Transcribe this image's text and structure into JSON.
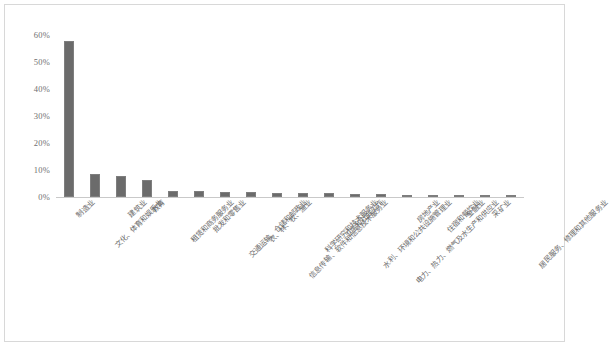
{
  "chart_data": {
    "type": "bar",
    "title": "",
    "xlabel": "",
    "ylabel": "",
    "ylim": [
      0,
      60
    ],
    "grid": false,
    "legend": false,
    "units": "percent",
    "bar_color": "#6b6b6b",
    "yticks": [
      "0%",
      "10%",
      "20%",
      "30%",
      "40%",
      "50%",
      "60%"
    ],
    "ytick_values": [
      0,
      10,
      20,
      30,
      40,
      50,
      60
    ],
    "categories": [
      "制造业",
      "文化、体育和娱乐业",
      "建筑业",
      "教育",
      "租赁和商务服务业",
      "批发和零售业",
      "交通运输、仓储和邮政业",
      "农、林、牧、渔业",
      "信息传输、软件和信息技术服务业",
      "科学研究和技术服务业",
      "卫生和社会工作",
      "水利、环境和公共设施管理业",
      "电力、热力、燃气及水生产和供应业",
      "房地产业",
      "住宿和餐饮业",
      "金融业",
      "采矿业",
      "居民服务、修理和其他服务业"
    ],
    "values": [
      57.8,
      8.5,
      7.6,
      6.3,
      2.3,
      2.1,
      1.9,
      1.7,
      1.6,
      1.5,
      1.4,
      1.2,
      1.0,
      0.9,
      0.7,
      0.5,
      0.3,
      0.2
    ]
  }
}
